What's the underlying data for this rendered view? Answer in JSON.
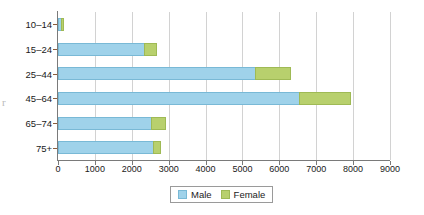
{
  "chart_data": {
    "type": "bar",
    "orientation": "horizontal",
    "stacked": true,
    "title": "",
    "subtitle": "",
    "xlabel": "",
    "ylabel": "",
    "categories": [
      "10–14",
      "15–24",
      "25–44",
      "45–64",
      "65–74",
      "75+"
    ],
    "series": [
      {
        "name": "Male",
        "color": "#9fd2ea",
        "values": [
          110,
          2360,
          5360,
          6570,
          2560,
          2610
        ]
      },
      {
        "name": "Female",
        "color": "#b8d06d",
        "values": [
          90,
          360,
          970,
          1390,
          400,
          200
        ]
      }
    ],
    "totals": [
      200,
      2720,
      6330,
      7960,
      2960,
      2810
    ],
    "xlim": [
      0,
      9000
    ],
    "xticks": [
      0,
      1000,
      2000,
      3000,
      4000,
      5000,
      6000,
      7000,
      8000,
      9000
    ],
    "xticklabels": [
      "0",
      "1000",
      "2000",
      "3000",
      "4000",
      "5000",
      "6000",
      "7000",
      "8000",
      "9000"
    ],
    "grid": "vertical",
    "legend_position": "bottom-center",
    "legend_entries": [
      "Male",
      "Female"
    ]
  },
  "legend": {
    "items": [
      {
        "label": "Male",
        "swatch_class": "male",
        "icon": "square-swatch-icon"
      },
      {
        "label": "Female",
        "swatch_class": "female",
        "icon": "square-swatch-icon"
      }
    ]
  },
  "artifact": {
    "glyph": "r"
  }
}
